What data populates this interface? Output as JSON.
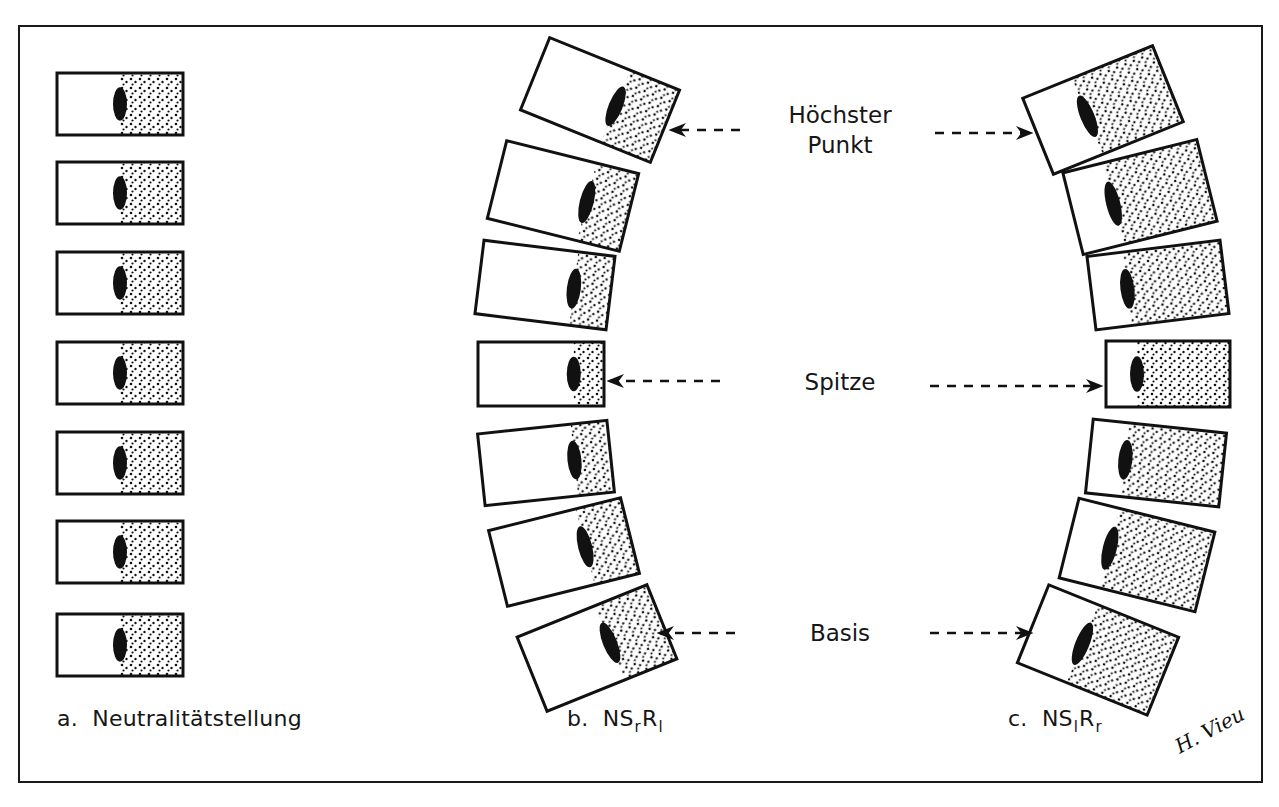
{
  "figure": {
    "stroke_color": "#111111",
    "background": "#ffffff",
    "signature": "H. Vieu"
  },
  "labels": {
    "highest_point_line1": "Höchster",
    "highest_point_line2": "Punkt",
    "apex": "Spitze",
    "base": "Basis"
  },
  "captions": {
    "a": {
      "prefix": "a.",
      "text": "Neutralitätstellung"
    },
    "b": {
      "prefix": "b.",
      "ns": "NS",
      "s_sub": "r",
      "r": "R",
      "r_sub": "l"
    },
    "c": {
      "prefix": "c.",
      "ns": "NS",
      "s_sub": "l",
      "r": "R",
      "r_sub": "r"
    }
  },
  "columns": {
    "a": {
      "name": "neutral",
      "vertebrae": [
        {
          "cx": 120,
          "cy": 104,
          "w": 126,
          "h": 62,
          "rot": 0,
          "split": 0.5
        },
        {
          "cx": 120,
          "cy": 193,
          "w": 126,
          "h": 62,
          "rot": 0,
          "split": 0.5
        },
        {
          "cx": 120,
          "cy": 283,
          "w": 126,
          "h": 62,
          "rot": 0,
          "split": 0.5
        },
        {
          "cx": 120,
          "cy": 373,
          "w": 126,
          "h": 62,
          "rot": 0,
          "split": 0.5
        },
        {
          "cx": 120,
          "cy": 463,
          "w": 126,
          "h": 62,
          "rot": 0,
          "split": 0.5
        },
        {
          "cx": 120,
          "cy": 552,
          "w": 126,
          "h": 62,
          "rot": 0,
          "split": 0.5
        },
        {
          "cx": 120,
          "cy": 645,
          "w": 126,
          "h": 62,
          "rot": 0,
          "split": 0.5
        }
      ]
    },
    "b": {
      "name": "NSrRl",
      "vertebrae": [
        {
          "cx": 600,
          "cy": 100,
          "w": 140,
          "h": 78,
          "rot": 22,
          "split": 0.62
        },
        {
          "cx": 563,
          "cy": 196,
          "w": 136,
          "h": 80,
          "rot": 14,
          "split": 0.68
        },
        {
          "cx": 545,
          "cy": 285,
          "w": 132,
          "h": 74,
          "rot": 7,
          "split": 0.72
        },
        {
          "cx": 541,
          "cy": 374,
          "w": 126,
          "h": 64,
          "rot": 0,
          "split": 0.76
        },
        {
          "cx": 546,
          "cy": 463,
          "w": 130,
          "h": 72,
          "rot": -6,
          "split": 0.72
        },
        {
          "cx": 564,
          "cy": 552,
          "w": 136,
          "h": 78,
          "rot": -14,
          "split": 0.66
        },
        {
          "cx": 597,
          "cy": 648,
          "w": 140,
          "h": 80,
          "rot": -22,
          "split": 0.6
        }
      ]
    },
    "c": {
      "name": "NSlRr",
      "vertebrae": [
        {
          "cx": 1103,
          "cy": 110,
          "w": 140,
          "h": 82,
          "rot": -22,
          "split": 0.38
        },
        {
          "cx": 1140,
          "cy": 197,
          "w": 138,
          "h": 84,
          "rot": -14,
          "split": 0.3
        },
        {
          "cx": 1158,
          "cy": 285,
          "w": 134,
          "h": 74,
          "rot": -7,
          "split": 0.27
        },
        {
          "cx": 1168,
          "cy": 374,
          "w": 124,
          "h": 66,
          "rot": 0,
          "split": 0.25
        },
        {
          "cx": 1156,
          "cy": 463,
          "w": 134,
          "h": 74,
          "rot": 6,
          "split": 0.27
        },
        {
          "cx": 1137,
          "cy": 555,
          "w": 140,
          "h": 82,
          "rot": 14,
          "split": 0.3
        },
        {
          "cx": 1098,
          "cy": 650,
          "w": 140,
          "h": 84,
          "rot": 22,
          "split": 0.38
        }
      ]
    }
  },
  "arrows": [
    {
      "name": "arrow-highest-left",
      "x1": 740,
      "y1": 130,
      "x2": 672,
      "y2": 130
    },
    {
      "name": "arrow-highest-right",
      "x1": 935,
      "y1": 133,
      "x2": 1030,
      "y2": 133
    },
    {
      "name": "arrow-apex-left",
      "x1": 720,
      "y1": 381,
      "x2": 610,
      "y2": 381
    },
    {
      "name": "arrow-apex-right",
      "x1": 930,
      "y1": 386,
      "x2": 1100,
      "y2": 386
    },
    {
      "name": "arrow-base-left",
      "x1": 735,
      "y1": 633,
      "x2": 660,
      "y2": 633
    },
    {
      "name": "arrow-base-right",
      "x1": 930,
      "y1": 633,
      "x2": 1030,
      "y2": 633
    }
  ]
}
